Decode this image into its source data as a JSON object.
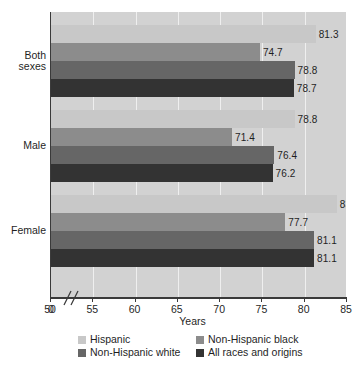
{
  "chart_data": {
    "type": "bar",
    "orientation": "horizontal",
    "title": "",
    "xlabel": "Years",
    "ylabel": "",
    "xlim": [
      50,
      85
    ],
    "xticks": [
      50,
      55,
      60,
      65,
      70,
      75,
      80,
      85
    ],
    "xtick_labels": [
      "50",
      "55",
      "60",
      "65",
      "70",
      "75",
      "80",
      "85"
    ],
    "origin_tick_label": "0",
    "axis_break": true,
    "grid": true,
    "legend_position": "bottom",
    "categories": [
      "Both sexes",
      "Male",
      "Female"
    ],
    "category_labels_wrapped": [
      [
        "Both",
        "sexes"
      ],
      [
        "Male"
      ],
      [
        "Female"
      ]
    ],
    "series": [
      {
        "name": "Hispanic",
        "color": "#c8c8c8",
        "values": [
          81.3,
          78.8,
          83.8
        ],
        "labels": [
          "81.3",
          "78.8",
          "83.8"
        ]
      },
      {
        "name": "Non-Hispanic black",
        "color": "#8c8c8c",
        "values": [
          74.7,
          71.4,
          77.7
        ],
        "labels": [
          "74.7",
          "71.4",
          "77.7"
        ]
      },
      {
        "name": "Non-Hispanic white",
        "color": "#666666",
        "values": [
          78.8,
          76.4,
          81.1
        ],
        "labels": [
          "78.8",
          "76.4",
          "81.1"
        ]
      },
      {
        "name": "All races and origins",
        "color": "#333333",
        "values": [
          78.7,
          76.2,
          81.1
        ],
        "labels": [
          "78.7",
          "76.2",
          "81.1"
        ]
      }
    ],
    "plot_background": "#d2d2d2",
    "gridline_color": "#efefef",
    "axis_color": "#3a3a3a"
  },
  "legend": {
    "entries": [
      {
        "label": "Hispanic",
        "color": "#c8c8c8"
      },
      {
        "label": "Non-Hispanic black",
        "color": "#8c8c8c"
      },
      {
        "label": "Non-Hispanic white",
        "color": "#666666"
      },
      {
        "label": "All races and origins",
        "color": "#333333"
      }
    ]
  },
  "axis": {
    "x_title": "Years"
  }
}
